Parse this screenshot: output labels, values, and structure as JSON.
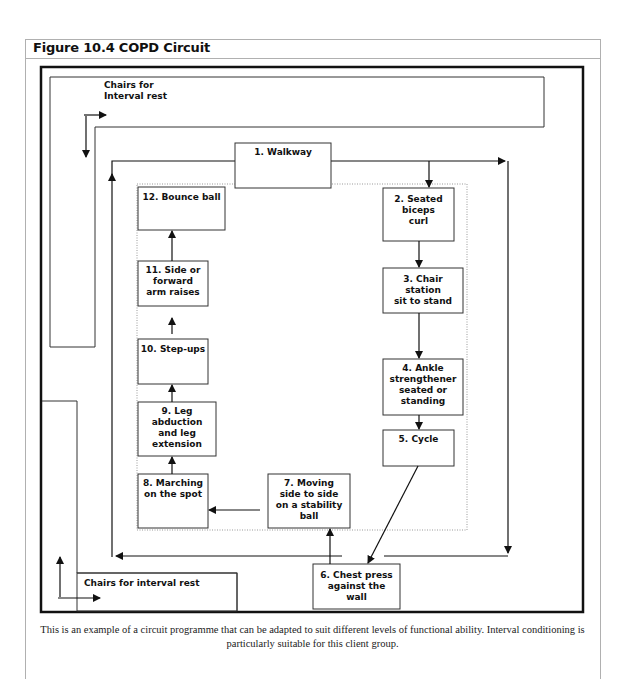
{
  "figure": {
    "title": "Figure 10.4 COPD Circuit",
    "caption": "This is an example of a circuit programme that can be adapted to suit different levels of functional ability. Interval conditioning is particularly suitable for this client group."
  },
  "areas": {
    "rest_top": "Chairs for\nInterval rest",
    "rest_bottom": "Chairs for interval rest"
  },
  "stations": [
    {
      "id": 1,
      "label": "1. Walkway"
    },
    {
      "id": 2,
      "label": "2. Seated\nbiceps\ncurl"
    },
    {
      "id": 3,
      "label": "3. Chair\nstation\nsit to stand"
    },
    {
      "id": 4,
      "label": "4. Ankle\nstrengthener\nseated or\nstanding"
    },
    {
      "id": 5,
      "label": "5. Cycle"
    },
    {
      "id": 6,
      "label": "6. Chest press\nagainst the\nwall"
    },
    {
      "id": 7,
      "label": "7. Moving\nside to side\non a stability\nball"
    },
    {
      "id": 8,
      "label": "8. Marching\non the spot"
    },
    {
      "id": 9,
      "label": "9. Leg\nabduction\nand leg\nextension"
    },
    {
      "id": 10,
      "label": "10. Step-ups"
    },
    {
      "id": 11,
      "label": "11. Side or\nforward\narm raises"
    },
    {
      "id": 12,
      "label": "12. Bounce ball"
    }
  ],
  "flow": [
    "1 → 2",
    "2 → 3",
    "3 → 4",
    "4 → 5",
    "5 → 6",
    "6 → 7",
    "7 → 8",
    "8 → 9",
    "9 → 10",
    "10 → 11",
    "11 → 12"
  ]
}
